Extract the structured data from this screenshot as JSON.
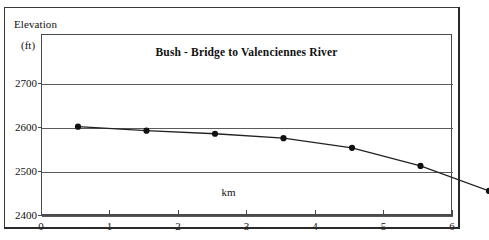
{
  "figure": {
    "y_axis_title": "Elevation",
    "y_axis_units": "(ft)"
  },
  "chart_data": {
    "type": "line",
    "title": "Bush - Bridge to Valenciennes River",
    "xlabel": "km",
    "ylabel": "Elevation (ft)",
    "x": [
      0,
      1,
      2,
      3,
      4,
      5,
      6
    ],
    "values": [
      2662,
      2653,
      2646,
      2636,
      2614,
      2573,
      2516
    ],
    "series": [
      {
        "name": "Elevation profile",
        "values": [
          2662,
          2653,
          2646,
          2636,
          2614,
          2573,
          2516
        ]
      }
    ],
    "xtick_labels": [
      "0",
      "1",
      "2",
      "3",
      "4",
      "5",
      "6"
    ],
    "ytick_labels": [
      "2400",
      "2500",
      "2600",
      "2700"
    ],
    "ytick_values": [
      2400,
      2500,
      2600,
      2700
    ],
    "xlim": [
      0,
      6
    ],
    "ylim": [
      2400,
      2750
    ],
    "grid": "horizontal",
    "legend": "none",
    "marker": "filled-circle",
    "line_color": "#222222",
    "marker_color": "#111111",
    "grid_color": "#5a5a5a",
    "frame_color": "#4a4a4a",
    "background_color": "#ffffff"
  }
}
